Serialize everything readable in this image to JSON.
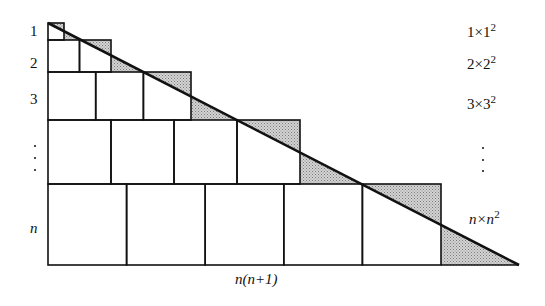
{
  "diagram": {
    "type": "proof-without-words",
    "left_labels": [
      "1",
      "2",
      "3",
      "n"
    ],
    "right_labels": [
      {
        "base": "1×1",
        "exp": "2"
      },
      {
        "base": "2×2",
        "exp": "2"
      },
      {
        "base": "3×3",
        "exp": "2"
      },
      {
        "base": "n×n",
        "exp": "2"
      }
    ],
    "bottom_label": "n(n+1)",
    "rows": [
      {
        "label": "1",
        "count": 1,
        "y": 23,
        "height": 17,
        "x_end": 64
      },
      {
        "label": "2",
        "count": 2,
        "y": 40,
        "height": 32,
        "x_end": 111
      },
      {
        "label": "3",
        "count": 3,
        "y": 72,
        "height": 48,
        "x_end": 191
      },
      {
        "label": "...",
        "count": 4,
        "y": 120,
        "height": 64,
        "x_end": 300
      },
      {
        "label": "n",
        "count": 5,
        "y": 184,
        "height": 81,
        "x_end": 441
      }
    ],
    "diagonal": {
      "x1": 48,
      "y1": 23,
      "x2": 519,
      "y2": 265
    },
    "colors": {
      "line": "#111111",
      "shade": "#b8b8b8",
      "background": "#ffffff"
    }
  }
}
